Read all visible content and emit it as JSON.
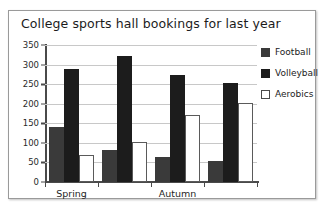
{
  "chart_data": {
    "type": "bar",
    "title": "College sports hall bookings for last year",
    "xlabel": "",
    "ylabel": "",
    "ylim": [
      0,
      350
    ],
    "yticks": [
      0,
      50,
      100,
      150,
      200,
      250,
      300,
      350
    ],
    "grid": true,
    "legend_position": "right",
    "categories": [
      "Spring",
      "",
      "Autumn",
      ""
    ],
    "tick_labels": [
      "Spring",
      "Autumn"
    ],
    "series": [
      {
        "name": "Football",
        "color": "#3a3a3a",
        "values": [
          140,
          82,
          64,
          54
        ]
      },
      {
        "name": "Volleyball",
        "color": "#1c1c1c",
        "values": [
          290,
          322,
          273,
          252
        ]
      },
      {
        "name": "Aerobics",
        "color": "#ffffff",
        "values": [
          70,
          102,
          172,
          203
        ]
      }
    ]
  },
  "legend": {
    "items": [
      {
        "label": "Football"
      },
      {
        "label": "Volleyball"
      },
      {
        "label": "Aerobics"
      }
    ]
  }
}
